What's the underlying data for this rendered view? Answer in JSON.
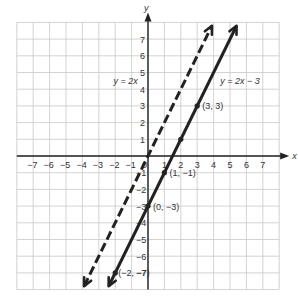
{
  "chart_data": {
    "type": "line",
    "title": "",
    "xlabel": "x",
    "ylabel": "y",
    "xlim": [
      -8,
      8
    ],
    "ylim": [
      -8,
      8
    ],
    "grid": true,
    "x_ticks": [
      -7,
      -6,
      -5,
      -4,
      -3,
      -2,
      -1,
      0,
      1,
      2,
      3,
      4,
      5,
      6,
      7
    ],
    "y_ticks": [
      -7,
      -6,
      -5,
      -4,
      -3,
      -2,
      -1,
      1,
      2,
      3,
      4,
      5,
      6,
      7
    ],
    "series": [
      {
        "name": "y = 2x",
        "equation": "y = 2x",
        "style": "dashed",
        "color": "#222222",
        "x": [
          -3.9,
          3.9
        ],
        "y": [
          -7.8,
          7.8
        ]
      },
      {
        "name": "y = 2x − 3",
        "equation": "y = 2x − 3",
        "style": "solid",
        "color": "#222222",
        "x": [
          -2.4,
          5.4
        ],
        "y": [
          -7.8,
          7.8
        ]
      }
    ],
    "points": [
      {
        "x": 3,
        "y": 3,
        "label": "(3, 3)"
      },
      {
        "x": 1,
        "y": -1,
        "label": "(1, −1)"
      },
      {
        "x": 0,
        "y": -3,
        "label": "(0, −3)"
      },
      {
        "x": -2,
        "y": -7,
        "label": "(−2, −7)"
      },
      {
        "x": 2,
        "y": 1,
        "label": ""
      }
    ],
    "annotations": [
      {
        "text": "y = 2x",
        "x": -2.1,
        "y": 4.3
      },
      {
        "text": "y = 2x − 3",
        "x": 4.4,
        "y": 4.3
      }
    ],
    "legend": "none"
  },
  "labels": {
    "x_axis": "x",
    "y_axis": "y",
    "line1": "y = 2x",
    "line2": "y = 2x − 3"
  }
}
